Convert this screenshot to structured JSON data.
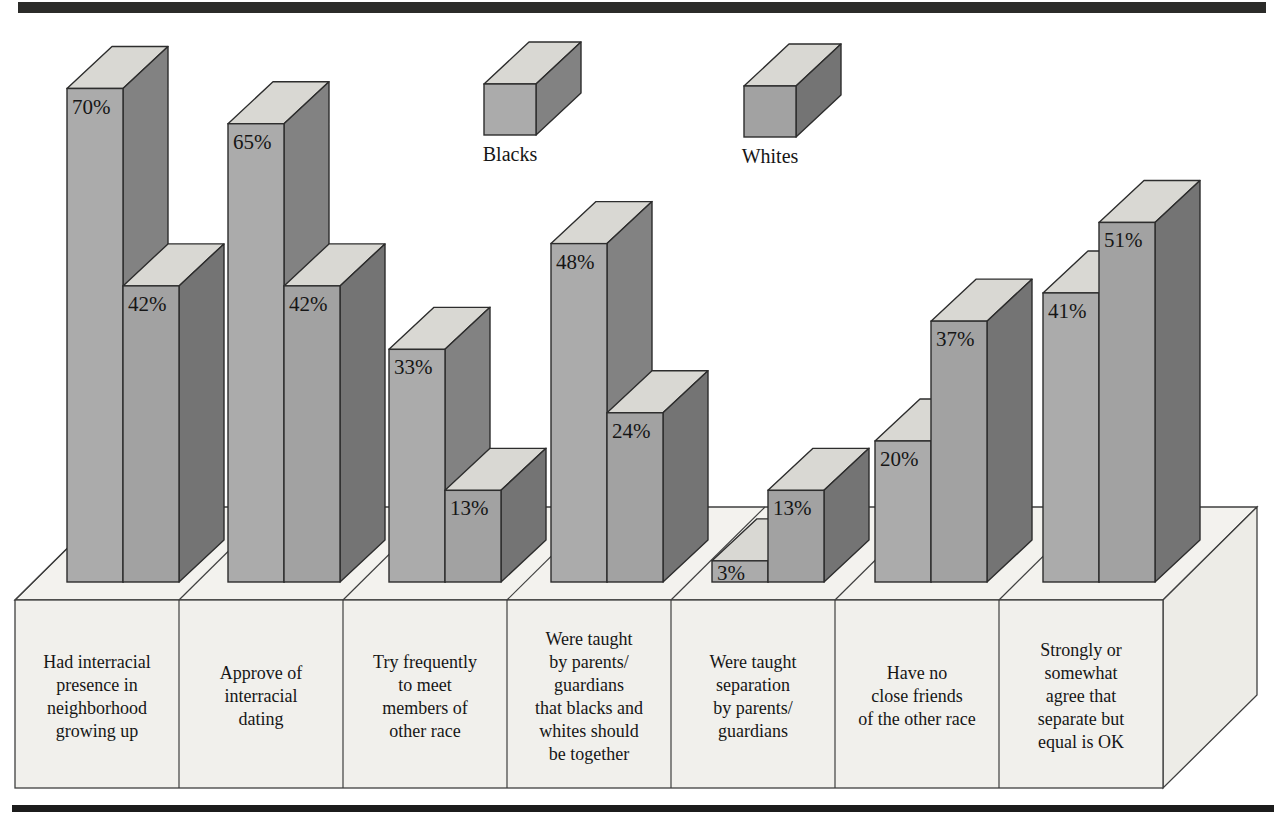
{
  "legend": {
    "items": [
      {
        "label": "Blacks"
      },
      {
        "label": "Whites"
      }
    ]
  },
  "chart_data": {
    "type": "bar",
    "projection": "3d-oblique-paired-bars",
    "categories": [
      "Had interracial presence in neighborhood growing up",
      "Approve of interracial dating",
      "Try frequently to meet members of other race",
      "Were taught by parents/ guardians that blacks and whites should be together",
      "Were taught separation by parents/ guardians",
      "Have no close friends of the other race",
      "Strongly or somewhat agree that separate but equal is OK"
    ],
    "category_lines": [
      [
        "Had interracial",
        "presence in",
        "neighborhood",
        "growing up"
      ],
      [
        "Approve of",
        "interracial",
        "dating"
      ],
      [
        "Try frequently",
        "to meet",
        "members of",
        "other race"
      ],
      [
        "Were taught",
        "by parents/",
        "guardians",
        "that blacks and",
        "whites should",
        "be together"
      ],
      [
        "Were taught",
        "separation",
        "by parents/",
        "guardians"
      ],
      [
        "Have no",
        "close friends",
        "of the other race"
      ],
      [
        "Strongly or",
        "somewhat",
        "agree that",
        "separate but",
        "equal is OK"
      ]
    ],
    "series": [
      {
        "name": "Blacks",
        "values": [
          70,
          65,
          33,
          48,
          3,
          20,
          41
        ]
      },
      {
        "name": "Whites",
        "values": [
          42,
          42,
          13,
          24,
          13,
          37,
          51
        ]
      }
    ],
    "value_suffix": "%",
    "value_labels": [
      [
        "70%",
        "65%",
        "33%",
        "48%",
        "3%",
        "20%",
        "41%"
      ],
      [
        "42%",
        "42%",
        "13%",
        "24%",
        "13%",
        "37%",
        "51%"
      ]
    ],
    "ylim": [
      0,
      100
    ],
    "axes_shown": false,
    "grid": false,
    "legend_position": "top-center"
  },
  "colors": {
    "background": "#ffffff",
    "bar_front_blacks": "#ababab",
    "bar_front_whites": "#a2a2a2",
    "bar_top": "#d9d8d3",
    "bar_side_blacks": "#828282",
    "bar_side_whites": "#747474",
    "bar_outline": "#2d2d2d",
    "platform_face": "#f1f0ec",
    "platform_top": "#f3f2ee",
    "platform_side": "#edece7",
    "platform_outline": "#3f3f3f",
    "rule_top": "#2b2b29",
    "rule_bottom": "#1c1c1c",
    "text": "#161616"
  }
}
